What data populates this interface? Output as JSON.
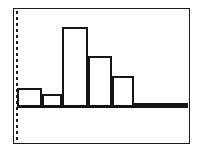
{
  "figure": {
    "title": "",
    "background_color": "#ffffff",
    "frame_color": "#1a1a1a",
    "bar_outline_color": "#141414",
    "bar_fill_color": "#ffffff"
  },
  "axis": {
    "y_axis_style": "dotted",
    "y_axis_color": "#1a1a1a",
    "x_axis_style": "solid",
    "tick_labels": [],
    "axis_label_x": "",
    "axis_label_y": ""
  },
  "chart_data": {
    "type": "bar",
    "title": "",
    "subtitle": "",
    "xlabel": "",
    "ylabel": "",
    "categories": [
      "1",
      "2",
      "3",
      "4",
      "5",
      "6",
      "7"
    ],
    "values": [
      19,
      13,
      80,
      51,
      31,
      4,
      3
    ],
    "bar_left_px": [
      0,
      25,
      45,
      71,
      95,
      117,
      145
    ],
    "bar_width_px": [
      25,
      20,
      26,
      24,
      22,
      28,
      26
    ],
    "ylim": [
      0,
      99
    ],
    "grid": false,
    "legend": [],
    "legend_position": "none",
    "annotations": []
  }
}
